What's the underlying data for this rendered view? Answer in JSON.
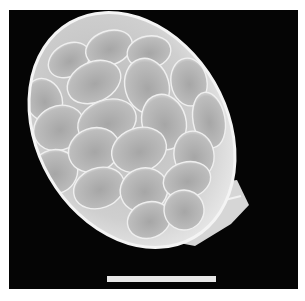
{
  "image": {
    "description": "Grayscale scanning electron micrograph of an ovoid body covered in overlapping oval scales, with a basal collar, on a black background",
    "background_color": "#050505",
    "frame_color": "#ffffff",
    "specimen_color": "#d8d8d8",
    "scale_bar": {
      "color": "#e8e8e8",
      "label": ""
    }
  }
}
